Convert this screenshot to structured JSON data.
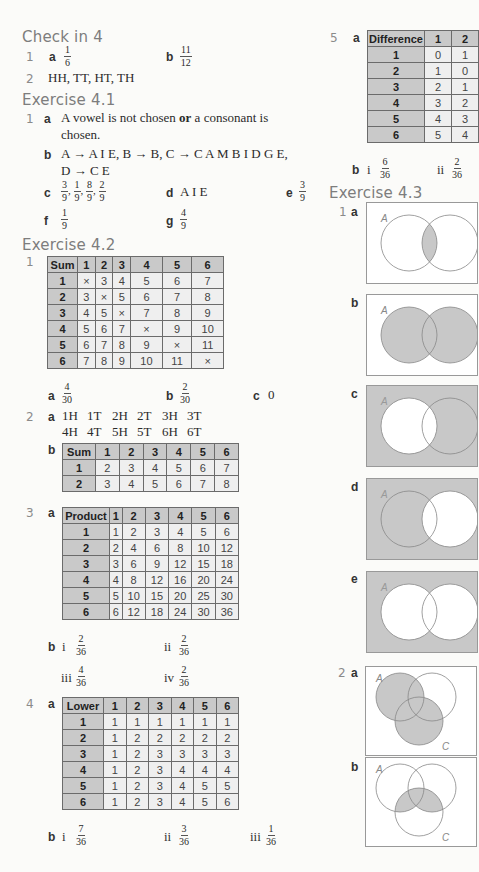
{
  "check_in": {
    "title": "Check in 4",
    "q1": {
      "num": "1",
      "a_label": "a",
      "a_num": "1",
      "a_den": "6",
      "b_label": "b",
      "b_num": "11",
      "b_den": "12"
    },
    "q2": {
      "num": "2",
      "text": "HH, TT, HT, TH"
    }
  },
  "ex41": {
    "title": "Exercise 4.1",
    "q1": {
      "num": "1",
      "a_label": "a",
      "a_text1": "A vowel is not chosen ",
      "a_or": "or",
      "a_text2": " a consonant is",
      "a_text3": "chosen.",
      "b_label": "b",
      "b_line1": "A → A I E,  B → B,  C → C A M B I D G E,",
      "b_line2": "D → C E",
      "c_label": "c",
      "c_fracs": [
        {
          "n": "3",
          "d": "9"
        },
        {
          "n": "1",
          "d": "9"
        },
        {
          "n": "8",
          "d": "9"
        },
        {
          "n": "2",
          "d": "9"
        }
      ],
      "d_label": "d",
      "d_text": "A I E",
      "e_label": "e",
      "e_num": "3",
      "e_den": "9",
      "f_label": "f",
      "f_num": "1",
      "f_den": "9",
      "g_label": "g",
      "g_num": "4",
      "g_den": "9"
    }
  },
  "ex42": {
    "title": "Exercise 4.2",
    "q1": {
      "num": "1",
      "table": {
        "header": [
          "Sum",
          "1",
          "2",
          "3",
          "4",
          "5",
          "6"
        ],
        "rows": [
          [
            "1",
            "×",
            "3",
            "4",
            "5",
            "6",
            "7"
          ],
          [
            "2",
            "3",
            "×",
            "5",
            "6",
            "7",
            "8"
          ],
          [
            "3",
            "4",
            "5",
            "×",
            "7",
            "8",
            "9"
          ],
          [
            "4",
            "5",
            "6",
            "7",
            "×",
            "9",
            "10"
          ],
          [
            "5",
            "6",
            "7",
            "8",
            "9",
            "×",
            "11"
          ],
          [
            "6",
            "7",
            "8",
            "9",
            "10",
            "11",
            "×"
          ]
        ]
      },
      "a_label": "a",
      "a_num": "4",
      "a_den": "30",
      "b_label": "b",
      "b_num": "2",
      "b_den": "30",
      "c_label": "c",
      "c_text": "0"
    },
    "q2": {
      "num": "2",
      "a_label": "a",
      "a_row1": [
        "1H",
        "1T",
        "2H",
        "2T",
        "3H",
        "3T"
      ],
      "a_row2": [
        "4H",
        "4T",
        "5H",
        "5T",
        "6H",
        "6T"
      ],
      "b_label": "b",
      "table": {
        "header": [
          "Sum",
          "1",
          "2",
          "3",
          "4",
          "5",
          "6"
        ],
        "rows": [
          [
            "1",
            "2",
            "3",
            "4",
            "5",
            "6",
            "7"
          ],
          [
            "2",
            "3",
            "4",
            "5",
            "6",
            "7",
            "8"
          ]
        ]
      }
    },
    "q3": {
      "num": "3",
      "a_label": "a",
      "table": {
        "header": [
          "Product",
          "1",
          "2",
          "3",
          "4",
          "5",
          "6"
        ],
        "rows": [
          [
            "1",
            "1",
            "2",
            "3",
            "4",
            "5",
            "6"
          ],
          [
            "2",
            "2",
            "4",
            "6",
            "8",
            "10",
            "12"
          ],
          [
            "3",
            "3",
            "6",
            "9",
            "12",
            "15",
            "18"
          ],
          [
            "4",
            "4",
            "8",
            "12",
            "16",
            "20",
            "24"
          ],
          [
            "5",
            "5",
            "10",
            "15",
            "20",
            "25",
            "30"
          ],
          [
            "6",
            "6",
            "12",
            "18",
            "24",
            "30",
            "36"
          ]
        ]
      },
      "b_label": "b",
      "answers": [
        {
          "label": "i",
          "n": "2",
          "d": "36"
        },
        {
          "label": "ii",
          "n": "2",
          "d": "36"
        },
        {
          "label": "iii",
          "n": "4",
          "d": "36"
        },
        {
          "label": "iv",
          "n": "2",
          "d": "36"
        }
      ]
    },
    "q4": {
      "num": "4",
      "a_label": "a",
      "table": {
        "header": [
          "Lower",
          "1",
          "2",
          "3",
          "4",
          "5",
          "6"
        ],
        "rows": [
          [
            "1",
            "1",
            "1",
            "1",
            "1",
            "1",
            "1"
          ],
          [
            "2",
            "1",
            "2",
            "2",
            "2",
            "2",
            "2"
          ],
          [
            "3",
            "1",
            "2",
            "3",
            "3",
            "3",
            "3"
          ],
          [
            "4",
            "1",
            "2",
            "3",
            "4",
            "4",
            "4"
          ],
          [
            "5",
            "1",
            "2",
            "3",
            "4",
            "5",
            "5"
          ],
          [
            "6",
            "1",
            "2",
            "3",
            "4",
            "5",
            "6"
          ]
        ]
      },
      "b_label": "b",
      "answers": [
        {
          "label": "i",
          "n": "7",
          "d": "36"
        },
        {
          "label": "ii",
          "n": "3",
          "d": "36"
        },
        {
          "label": "iii",
          "n": "1",
          "d": "36"
        }
      ]
    },
    "q5": {
      "num": "5",
      "a_label": "a",
      "table": {
        "header": [
          "Difference",
          "1",
          "2"
        ],
        "rows": [
          [
            "1",
            "0",
            "1"
          ],
          [
            "2",
            "1",
            "0"
          ],
          [
            "3",
            "2",
            "1"
          ],
          [
            "4",
            "3",
            "2"
          ],
          [
            "5",
            "4",
            "3"
          ],
          [
            "6",
            "5",
            "4"
          ]
        ]
      },
      "b_label": "b",
      "answers": [
        {
          "label": "i",
          "n": "6",
          "d": "36"
        },
        {
          "label": "ii",
          "n": "2",
          "d": "36"
        }
      ]
    }
  },
  "ex43": {
    "title": "Exercise 4.3",
    "q1": {
      "num": "1",
      "parts": [
        "a",
        "b",
        "c",
        "d",
        "e"
      ],
      "set_label": "A"
    },
    "q2": {
      "num": "2",
      "parts": [
        "a",
        "b"
      ],
      "set_a": "A",
      "set_c": "C"
    }
  },
  "colors": {
    "shade": "#c8c8c8",
    "header_cell": "#c9c9c9",
    "body_cell": "#efefef",
    "heading": "#7d7d7d"
  }
}
